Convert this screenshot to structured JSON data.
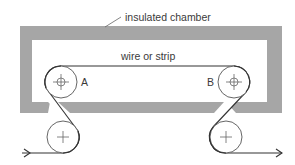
{
  "diagram": {
    "labels": {
      "chamber": "insulated chamber",
      "wire": "wire or strip",
      "pulley_a": "A",
      "pulley_b": "B"
    },
    "colors": {
      "chamber_fill": "#a6a6a6",
      "line": "#333333",
      "text": "#3a3a3a",
      "background": "#ffffff"
    },
    "pulleys": [
      {
        "id": "A",
        "role": "inside chamber, left",
        "cx": 61,
        "cy": 82,
        "r": 16,
        "center_mark": "crosshair-circle"
      },
      {
        "id": "B",
        "role": "inside chamber, right",
        "cx": 234,
        "cy": 82,
        "r": 16,
        "center_mark": "crosshair-circle"
      },
      {
        "id": "lower-left",
        "role": "feed pulley outside",
        "cx": 63,
        "cy": 137,
        "r": 16,
        "center_mark": "plus"
      },
      {
        "id": "lower-right",
        "role": "exit pulley outside",
        "cx": 226,
        "cy": 137,
        "r": 16,
        "center_mark": "plus"
      }
    ],
    "flow": {
      "input_arrow": "enters from left into lower-left pulley",
      "output_arrow": "exits right from lower-right pulley"
    }
  }
}
